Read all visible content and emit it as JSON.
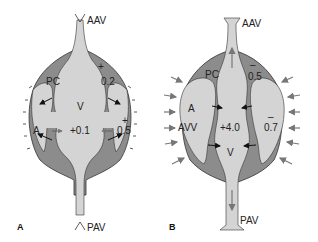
{
  "colors": {
    "light_fill": "#d4d4d4",
    "dark_fill": "#8c8c8c",
    "outline": "#333333",
    "arrow": "#111111",
    "grey_arrow": "#777777"
  },
  "panel_a": {
    "panel_label": "A",
    "top_label": "AAV",
    "bottom_label": "PAV",
    "pc_label": "PC",
    "v_label": "V",
    "a_label": "A",
    "pressure_pc": "0.2",
    "pressure_center": "+0.1",
    "pressure_right": "0.5",
    "sign_pc": "+",
    "sign_right": "+"
  },
  "panel_b": {
    "panel_label": "B",
    "top_label": "AAV",
    "bottom_label": "PAV",
    "pc_label": "PC",
    "a_label": "A",
    "avv_label": "AVV",
    "v_label": "V",
    "pressure_pc": "0.5",
    "pressure_center": "+4.0",
    "pressure_right": "0.7",
    "sign_pc": "–",
    "sign_right": "–"
  }
}
